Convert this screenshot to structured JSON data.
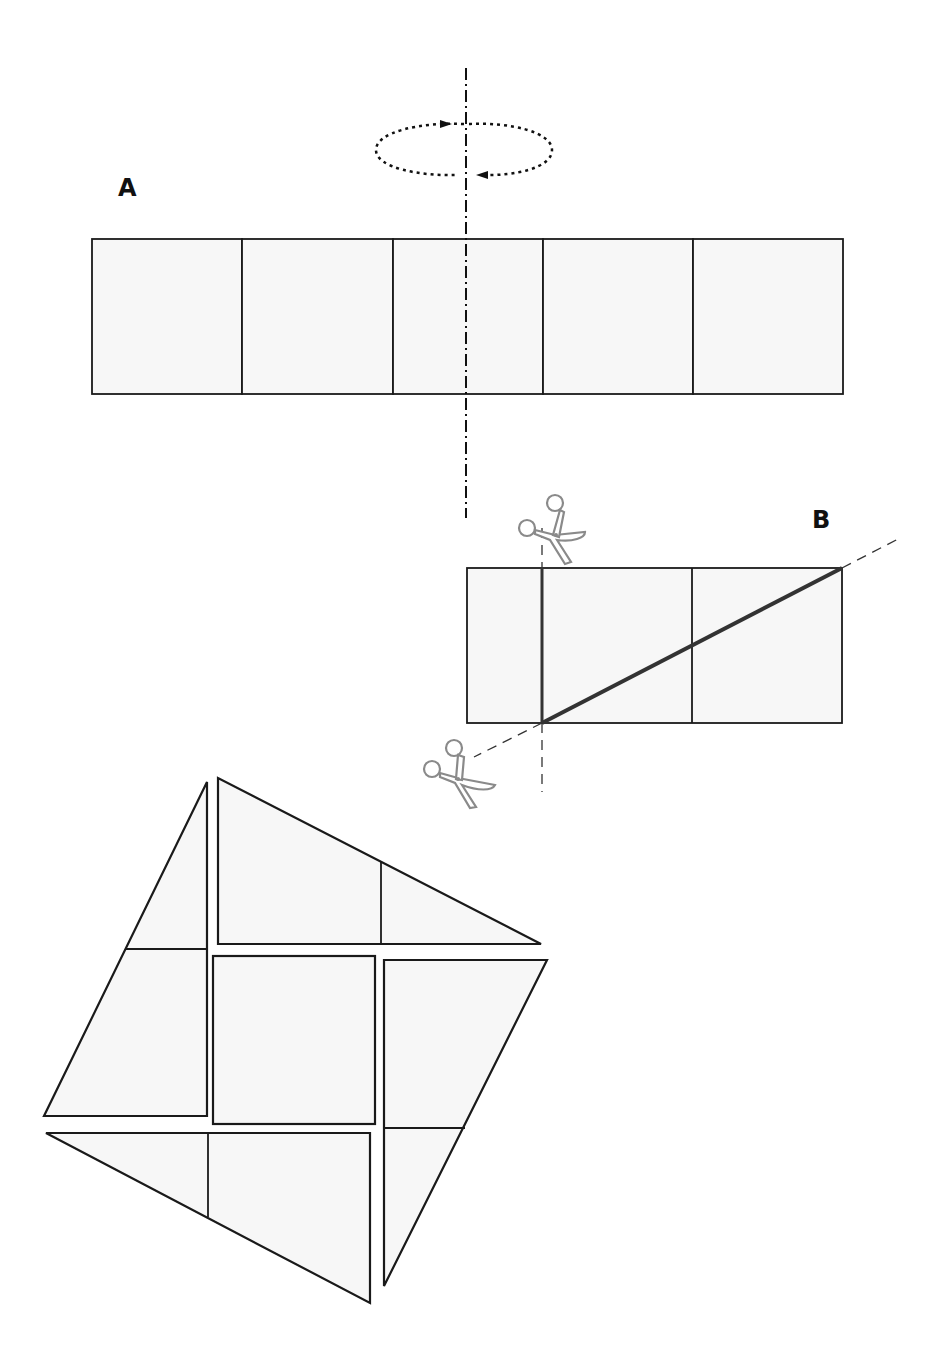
{
  "labels": {
    "A": "A",
    "B": "B"
  },
  "colors": {
    "stroke": "#1a1a1a",
    "fill": "#f7f7f7",
    "scissors": "#8a8a8a",
    "cut_line": "#333333"
  },
  "figure_A": {
    "description": "Strip of 5 equal squares with a vertical rotation axis through the middle square",
    "square_count": 5,
    "x": 92,
    "y": 239,
    "cell_size": 150.4,
    "height": 155,
    "rotation_axis_x": 466,
    "rotation_axis_y_range": [
      68,
      518
    ],
    "rotation_arrow": {
      "cx": 464,
      "cy": 150,
      "rx": 88,
      "ry": 26
    }
  },
  "figure_B": {
    "description": "Strip of 2.5 squares with a vertical cut and a diagonal cut",
    "x": 467,
    "y": 568,
    "width": 375,
    "height": 155,
    "divider_xs": [
      542,
      692
    ],
    "vertical_cut_x": 542,
    "diagonal_cut": {
      "from": [
        542,
        723
      ],
      "to": [
        842,
        568
      ]
    },
    "scissors": [
      {
        "name": "scissors-top",
        "x": 515,
        "y": 490
      },
      {
        "name": "scissors-bottom",
        "x": 420,
        "y": 735
      }
    ]
  },
  "tangram": {
    "description": "Seven pieces arranged into a tilted square",
    "pieces": [
      {
        "name": "left-trapezoid",
        "points": "207,782 207,1116 44,1116 126,949"
      },
      {
        "name": "top-triangle",
        "points": "218,778 218,944 541,944"
      },
      {
        "name": "center-square",
        "points": "213,956 375,956 375,1124 213,1124"
      },
      {
        "name": "right-trapezoid",
        "points": "384,960 547,960 386,1286 384,1286"
      },
      {
        "name": "bottom-triangle",
        "points": "46,1133 370,1133 370,1303"
      }
    ],
    "inner_lines": [
      {
        "name": "left-divider",
        "x1": 126,
        "y1": 949,
        "x2": 207,
        "y2": 949
      },
      {
        "name": "top-divider",
        "x1": 381,
        "y1": 861,
        "x2": 381,
        "y2": 944
      },
      {
        "name": "right-divider",
        "x1": 384,
        "y1": 1128,
        "x2": 465,
        "y2": 1128
      },
      {
        "name": "bottom-divider",
        "x1": 208,
        "y1": 1133,
        "x2": 208,
        "y2": 1217
      }
    ]
  }
}
